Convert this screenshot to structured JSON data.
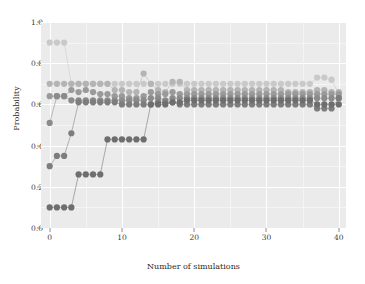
{
  "chart_data": {
    "type": "scatter",
    "title": "",
    "xlabel": "Number of simulations",
    "ylabel": "Probability",
    "xlim": [
      -1.2,
      41.0
    ],
    "ylim": [
      0.0,
      1.0
    ],
    "xticks": [
      0,
      10,
      20,
      30,
      40
    ],
    "xtick_labels": [
      "0",
      "10",
      "20",
      "30",
      "40"
    ],
    "yticks": [
      0.0,
      0.2,
      0.4,
      0.6,
      0.8,
      1.0
    ],
    "ytick_labels": [
      "0.0",
      "0.2",
      "0.4",
      "0.6",
      "0.8",
      "1.0"
    ],
    "grid": true,
    "grid_color": "#ffffff",
    "panel_background": "#ebebeb",
    "legend": "none",
    "marker": "circle",
    "marker_size": 3.1,
    "connected": true,
    "x": [
      0,
      1,
      2,
      3,
      4,
      5,
      6,
      7,
      8,
      9,
      10,
      11,
      12,
      13,
      14,
      15,
      16,
      17,
      18,
      19,
      20,
      21,
      22,
      23,
      24,
      25,
      26,
      27,
      28,
      29,
      30,
      31,
      32,
      33,
      34,
      35,
      36,
      37,
      38,
      39,
      40
    ],
    "series": [
      {
        "name": "series-a",
        "color": "#c9c9c9",
        "values": [
          0.9,
          0.9,
          0.9,
          0.7,
          0.7,
          0.7,
          0.7,
          0.7,
          0.7,
          0.7,
          0.7,
          0.7,
          0.7,
          0.7,
          0.7,
          0.7,
          0.7,
          0.7,
          0.7,
          0.7,
          0.7,
          0.7,
          0.7,
          0.7,
          0.7,
          0.7,
          0.7,
          0.7,
          0.7,
          0.7,
          0.7,
          0.7,
          0.7,
          0.7,
          0.7,
          0.7,
          0.7,
          0.73,
          0.73,
          0.72,
          0.65
        ]
      },
      {
        "name": "series-b",
        "color": "#b4b4b4",
        "values": [
          0.7,
          0.7,
          0.7,
          0.7,
          0.7,
          0.7,
          0.7,
          0.7,
          0.7,
          0.67,
          0.67,
          0.66,
          0.66,
          0.75,
          0.7,
          0.67,
          0.66,
          0.71,
          0.71,
          0.67,
          0.67,
          0.67,
          0.67,
          0.67,
          0.67,
          0.67,
          0.67,
          0.67,
          0.67,
          0.67,
          0.67,
          0.67,
          0.67,
          0.66,
          0.66,
          0.66,
          0.66,
          0.67,
          0.67,
          0.66,
          0.66
        ]
      },
      {
        "name": "series-c",
        "color": "#9a9a9a",
        "values": [
          0.64,
          0.64,
          0.64,
          0.67,
          0.66,
          0.67,
          0.66,
          0.65,
          0.65,
          0.64,
          0.64,
          0.63,
          0.63,
          0.64,
          0.66,
          0.65,
          0.65,
          0.66,
          0.65,
          0.65,
          0.65,
          0.65,
          0.65,
          0.65,
          0.65,
          0.65,
          0.65,
          0.65,
          0.65,
          0.65,
          0.65,
          0.65,
          0.65,
          0.65,
          0.65,
          0.65,
          0.65,
          0.65,
          0.65,
          0.65,
          0.65
        ]
      },
      {
        "name": "series-d",
        "color": "#8b8b8b",
        "values": [
          0.51,
          0.64,
          0.64,
          0.62,
          0.62,
          0.62,
          0.62,
          0.62,
          0.62,
          0.62,
          0.62,
          0.62,
          0.62,
          0.62,
          0.63,
          0.63,
          0.62,
          0.63,
          0.63,
          0.63,
          0.63,
          0.63,
          0.63,
          0.63,
          0.63,
          0.63,
          0.63,
          0.63,
          0.63,
          0.63,
          0.63,
          0.63,
          0.63,
          0.63,
          0.63,
          0.63,
          0.63,
          0.63,
          0.63,
          0.63,
          0.63
        ]
      },
      {
        "name": "series-e",
        "color": "#7d7d7d",
        "values": [
          0.3,
          0.35,
          0.35,
          0.46,
          0.61,
          0.61,
          0.61,
          0.61,
          0.61,
          0.61,
          0.6,
          0.6,
          0.6,
          0.6,
          0.6,
          0.61,
          0.61,
          0.61,
          0.6,
          0.6,
          0.6,
          0.6,
          0.6,
          0.6,
          0.6,
          0.6,
          0.6,
          0.6,
          0.6,
          0.6,
          0.6,
          0.6,
          0.6,
          0.6,
          0.6,
          0.6,
          0.6,
          0.58,
          0.58,
          0.58,
          0.63
        ]
      },
      {
        "name": "series-f",
        "color": "#6e6e6e",
        "values": [
          0.1,
          0.1,
          0.1,
          0.1,
          0.26,
          0.26,
          0.26,
          0.26,
          0.43,
          0.43,
          0.43,
          0.43,
          0.43,
          0.43,
          0.6,
          0.6,
          0.6,
          0.61,
          0.61,
          0.62,
          0.62,
          0.62,
          0.62,
          0.62,
          0.62,
          0.62,
          0.62,
          0.62,
          0.62,
          0.62,
          0.62,
          0.62,
          0.62,
          0.62,
          0.62,
          0.62,
          0.62,
          0.6,
          0.6,
          0.6,
          0.6
        ]
      }
    ]
  }
}
